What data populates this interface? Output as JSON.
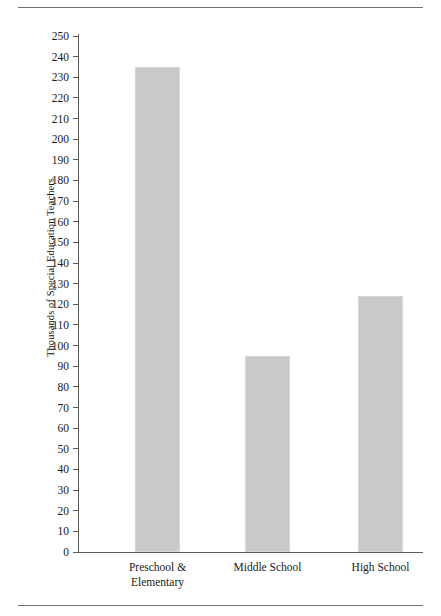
{
  "page": {
    "running_head": "",
    "rule_top_label": "top-rule",
    "rule_bottom_label": "bottom-rule"
  },
  "chart_data": {
    "type": "bar",
    "title": "",
    "subtitle": "",
    "xlabel": "",
    "ylabel": "Thousands of Special Education Teachers",
    "categories": [
      "Preschool & Elementary",
      "Middle School",
      "High School"
    ],
    "category_lines": [
      [
        "Preschool &",
        "Elementary"
      ],
      [
        "Middle School"
      ],
      [
        "High School"
      ]
    ],
    "values": [
      235,
      95,
      124
    ],
    "ylim": [
      0,
      250
    ],
    "ytick_step": 10,
    "yticks": [
      250,
      240,
      230,
      220,
      210,
      200,
      190,
      180,
      170,
      160,
      150,
      140,
      130,
      120,
      110,
      100,
      90,
      80,
      70,
      60,
      50,
      40,
      30,
      20,
      10,
      0
    ],
    "grid": false,
    "legend": false,
    "legend_position": "none",
    "bar_color": "#c9c9c9",
    "axis_color": "#5a5a5a",
    "text_color": "#1a1a1a"
  }
}
